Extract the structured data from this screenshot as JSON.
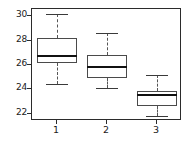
{
  "chart_data": {
    "type": "boxplot",
    "title": "",
    "xlabel": "",
    "ylabel": "",
    "categories": [
      "1",
      "2",
      "3"
    ],
    "x_tick_labels": [
      "1",
      "2",
      "3"
    ],
    "y_tick_labels": [
      "22",
      "24",
      "26",
      "28",
      "30"
    ],
    "y_ticks": [
      22,
      24,
      26,
      28,
      30
    ],
    "ylim": [
      21.4,
      30.6
    ],
    "grid": false,
    "legend": false,
    "boxes": [
      {
        "category": "1",
        "whisker_low": 24.4,
        "q1": 26.2,
        "median": 26.75,
        "q3": 28.2,
        "whisker_high": 30.2
      },
      {
        "category": "2",
        "whisker_low": 24.15,
        "q1": 24.95,
        "median": 25.8,
        "q3": 26.8,
        "whisker_high": 28.65
      },
      {
        "category": "3",
        "whisker_low": 21.8,
        "q1": 22.6,
        "median": 23.5,
        "q3": 23.9,
        "whisker_high": 25.2
      }
    ]
  },
  "style": {
    "frame_color": "#2b2b2b",
    "box_edge_color": "#4a4a4a",
    "median_color": "#111111",
    "whisker_color": "#555555",
    "background": "#ffffff"
  }
}
